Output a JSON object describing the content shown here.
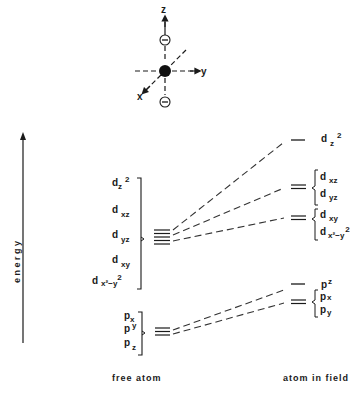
{
  "axes_figure": {
    "z_label": "z",
    "y_label": "y",
    "x_label": "x",
    "charge_symbol": "−"
  },
  "energy_axis": {
    "label": "energy"
  },
  "free_atom": {
    "label": "free atom",
    "d_orbitals": [
      {
        "base": "d",
        "sub": "z",
        "sup": "2"
      },
      {
        "base": "d",
        "sub": "xz",
        "sup": ""
      },
      {
        "base": "d",
        "sub": "yz",
        "sup": ""
      },
      {
        "base": "d",
        "sub": "xy",
        "sup": ""
      },
      {
        "base": "d",
        "sub": "x²−y",
        "sup": "2"
      }
    ],
    "p_orbitals": [
      {
        "base": "p",
        "sub": "x"
      },
      {
        "base": "p",
        "sub": "y"
      },
      {
        "base": "p",
        "sub": "z"
      }
    ]
  },
  "atom_in_field": {
    "label": "atom in field",
    "levels": [
      {
        "orbitals": [
          {
            "base": "d",
            "sub": "z",
            "sup": "2"
          }
        ]
      },
      {
        "orbitals": [
          {
            "base": "d",
            "sub": "xz"
          },
          {
            "base": "d",
            "sub": "yz"
          }
        ]
      },
      {
        "orbitals": [
          {
            "base": "d",
            "sub": "xy"
          },
          {
            "base": "d",
            "sub": "x²−y",
            "sup": "2"
          }
        ]
      },
      {
        "orbitals": [
          {
            "base": "p",
            "sub": "z"
          }
        ]
      },
      {
        "orbitals": [
          {
            "base": "p",
            "sub": "x"
          },
          {
            "base": "p",
            "sub": "y"
          }
        ]
      }
    ]
  }
}
